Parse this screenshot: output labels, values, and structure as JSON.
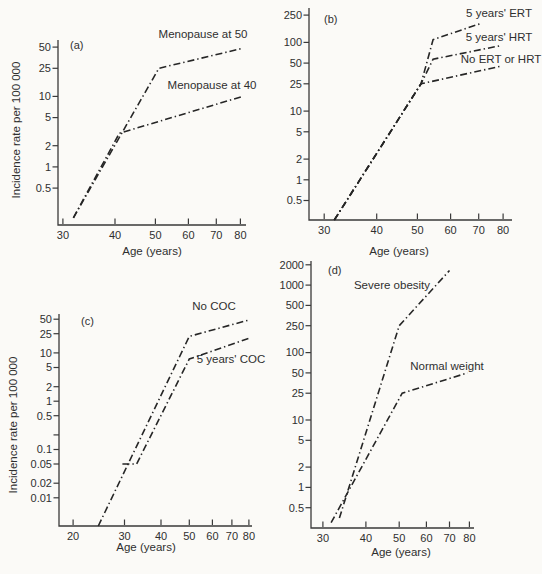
{
  "figure": {
    "background": "#fbfaf7",
    "axis_color": "#3a3a3a",
    "line_color": "#262626",
    "text_color": "#2f2f2f",
    "dash_pattern": "7 3 1.4 3"
  },
  "ylabels": [
    {
      "text": "Incidence rate per 100 000",
      "x": 20,
      "y": 130
    },
    {
      "text": "Incidence rate per 100 000",
      "x": 17,
      "y": 425
    }
  ],
  "chart_data": {
    "type": "line",
    "title": "",
    "panels": [
      {
        "id": "a",
        "panel_label": "(a)",
        "xlabel": "Age (years)",
        "xscale": "log",
        "yscale": "log",
        "xlim": [
          29.2,
          82.5
        ],
        "ylim": [
          0.15,
          63
        ],
        "x_ticks": [
          {
            "v": 30,
            "label": "30"
          },
          {
            "v": 40,
            "label": "40"
          },
          {
            "v": 50,
            "label": "50"
          },
          {
            "v": 60,
            "label": "60"
          },
          {
            "v": 70,
            "label": "70"
          },
          {
            "v": 80,
            "label": "80"
          }
        ],
        "y_ticks": [
          {
            "v": 50,
            "label": "50"
          },
          {
            "v": 25,
            "label": "25"
          },
          {
            "v": 10,
            "label": "10"
          },
          {
            "v": 5,
            "label": "5"
          },
          {
            "v": 2,
            "label": "2"
          },
          {
            "v": 1,
            "label": "1"
          },
          {
            "v": 0.5,
            "label": "0.5"
          }
        ],
        "series": [
          {
            "name": "Menopause at 50",
            "points": [
              [
                31.8,
                0.19
              ],
              [
                51,
                25
              ],
              [
                81,
                48
              ]
            ],
            "label": [
              203,
              38
            ]
          },
          {
            "name": "Menopause at 40",
            "points": [
              [
                31.8,
                0.19
              ],
              [
                41,
                3
              ],
              [
                81,
                10
              ]
            ],
            "label": [
              212,
              89
            ]
          }
        ],
        "layout": {
          "l": 58,
          "r": 246,
          "t": 40,
          "b": 225,
          "letter": [
            70,
            49
          ],
          "xlabel_xy": [
            152,
            255
          ]
        }
      },
      {
        "id": "b",
        "panel_label": "(b)",
        "xlabel": "Age (years)",
        "xscale": "log",
        "yscale": "log",
        "xlim": [
          27.6,
          84
        ],
        "ylim": [
          0.26,
          317
        ],
        "x_ticks": [
          {
            "v": 30,
            "label": "30"
          },
          {
            "v": 40,
            "label": "40"
          },
          {
            "v": 50,
            "label": "50"
          },
          {
            "v": 60,
            "label": "60"
          },
          {
            "v": 70,
            "label": "70"
          },
          {
            "v": 80,
            "label": "80"
          }
        ],
        "y_ticks": [
          {
            "v": 250,
            "label": "250"
          },
          {
            "v": 100,
            "label": "100"
          },
          {
            "v": 50,
            "label": "50"
          },
          {
            "v": 25,
            "label": "25"
          },
          {
            "v": 10,
            "label": "10"
          },
          {
            "v": 5,
            "label": "5"
          },
          {
            "v": 2,
            "label": "2"
          },
          {
            "v": 1,
            "label": "1"
          },
          {
            "v": 0.5,
            "label": "0.5"
          }
        ],
        "series": [
          {
            "name": "5 years' ERT",
            "points": [
              [
                31.7,
                0.26
              ],
              [
                51,
                25
              ],
              [
                54.5,
                110
              ],
              [
                71,
                190
              ]
            ],
            "label": [
              499,
              17
            ]
          },
          {
            "name": "5 years' HRT",
            "points": [
              [
                31.7,
                0.26
              ],
              [
                51,
                25
              ],
              [
                54.5,
                57
              ],
              [
                79,
                90
              ]
            ],
            "label": [
              499,
              41
            ]
          },
          {
            "name": "No ERT or HRT",
            "points": [
              [
                31.7,
                0.26
              ],
              [
                51,
                25
              ],
              [
                79,
                45
              ]
            ],
            "label": [
              501,
              63
            ]
          }
        ],
        "layout": {
          "l": 309,
          "r": 512,
          "t": 8,
          "b": 220,
          "letter": [
            324,
            23
          ],
          "xlabel_xy": [
            399,
            255
          ]
        }
      },
      {
        "id": "c",
        "panel_label": "(c)",
        "xlabel": "Age (years)",
        "xscale": "log",
        "yscale": "log",
        "xlim": [
          17.9,
          82
        ],
        "ylim": [
          0.0026,
          64
        ],
        "x_ticks": [
          {
            "v": 20,
            "label": "20"
          },
          {
            "v": 30,
            "label": "30"
          },
          {
            "v": 40,
            "label": "40"
          },
          {
            "v": 50,
            "label": "50"
          },
          {
            "v": 60,
            "label": "60"
          },
          {
            "v": 70,
            "label": "70"
          },
          {
            "v": 80,
            "label": "80"
          }
        ],
        "y_ticks": [
          {
            "v": 50,
            "label": "50"
          },
          {
            "v": 25,
            "label": "25"
          },
          {
            "v": 10,
            "label": "10"
          },
          {
            "v": 5,
            "label": "5"
          },
          {
            "v": 2,
            "label": "2"
          },
          {
            "v": 1,
            "label": "1"
          },
          {
            "v": 0.5,
            "label": "0.5"
          },
          {
            "v": 0.2,
            "label": ""
          },
          {
            "v": 0.1,
            "label": "0.1"
          },
          {
            "v": 0.05,
            "label": "0.05"
          },
          {
            "v": 0.02,
            "label": "0.02"
          },
          {
            "v": 0.01,
            "label": "0.01"
          }
        ],
        "series": [
          {
            "name": "No COC",
            "points": [
              [
                24.4,
                0.0026
              ],
              [
                50,
                22
              ],
              [
                80,
                48
              ]
            ],
            "label": [
              214,
              310
            ]
          },
          {
            "name": "5 years' COC",
            "points": [
              [
                29.5,
                0.05
              ],
              [
                33,
                0.05
              ],
              [
                50,
                7.5
              ],
              [
                80,
                20
              ]
            ],
            "label": [
              231,
              363
            ]
          }
        ],
        "layout": {
          "l": 59,
          "r": 252,
          "t": 314,
          "b": 526,
          "letter": [
            81,
            325
          ],
          "xlabel_xy": [
            146,
            551
          ]
        }
      },
      {
        "id": "d",
        "panel_label": "(d)",
        "xlabel": "Age (years)",
        "xscale": "log",
        "yscale": "log",
        "xlim": [
          27.7,
          82.5
        ],
        "ylim": [
          0.25,
          2280
        ],
        "x_ticks": [
          {
            "v": 30,
            "label": "30"
          },
          {
            "v": 40,
            "label": "40"
          },
          {
            "v": 50,
            "label": "50"
          },
          {
            "v": 60,
            "label": "60"
          },
          {
            "v": 70,
            "label": "70"
          },
          {
            "v": 80,
            "label": "80"
          }
        ],
        "y_ticks": [
          {
            "v": 2000,
            "label": "2000"
          },
          {
            "v": 1000,
            "label": "1000"
          },
          {
            "v": 500,
            "label": "500"
          },
          {
            "v": 250,
            "label": "250"
          },
          {
            "v": 100,
            "label": "100"
          },
          {
            "v": 50,
            "label": "50"
          },
          {
            "v": 25,
            "label": "25"
          },
          {
            "v": 10,
            "label": "10"
          },
          {
            "v": 5,
            "label": "5"
          },
          {
            "v": 2,
            "label": "2"
          },
          {
            "v": 1,
            "label": "1"
          },
          {
            "v": 0.5,
            "label": "0.5"
          }
        ],
        "series": [
          {
            "name": "Severe obesity",
            "points": [
              [
                33.5,
                0.35
              ],
              [
                50,
                250
              ],
              [
                70,
                1650
              ]
            ],
            "label": [
              392,
              289
            ]
          },
          {
            "name": "Normal weight",
            "points": [
              [
                31.7,
                0.3
              ],
              [
                51,
                25
              ],
              [
                79,
                50
              ]
            ],
            "label": [
              447,
              370
            ]
          }
        ],
        "layout": {
          "l": 311,
          "r": 474,
          "t": 261,
          "b": 528,
          "letter": [
            328,
            274
          ],
          "xlabel_xy": [
            401,
            556
          ]
        }
      }
    ]
  }
}
